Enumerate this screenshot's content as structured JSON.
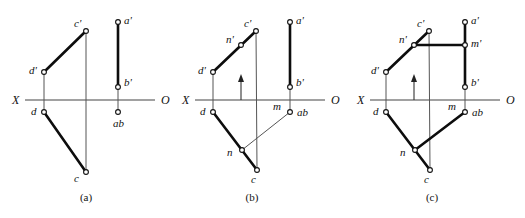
{
  "figure": {
    "background_color": "#ffffff",
    "ink_color": "#111111",
    "axis_label_left": "X",
    "axis_label_right": "O",
    "captions": [
      "(a)",
      "(b)",
      "(c)"
    ]
  },
  "panels": [
    {
      "id": "a",
      "caption": "(a)",
      "axis": {
        "left_label": "X",
        "right_label": "O",
        "y": 100,
        "x_start": 25,
        "x_end": 155
      },
      "points": [
        {
          "name": "c-prime",
          "label": "c'",
          "x": 86,
          "y": 31,
          "label_dx": -12,
          "label_dy": -4
        },
        {
          "name": "a-prime",
          "label": "a'",
          "x": 118,
          "y": 22,
          "label_dx": 6,
          "label_dy": 2
        },
        {
          "name": "d-prime",
          "label": "d'",
          "x": 44,
          "y": 72,
          "label_dx": -15,
          "label_dy": 2
        },
        {
          "name": "b-prime",
          "label": "b'",
          "x": 118,
          "y": 87,
          "label_dx": 6,
          "label_dy": -1
        },
        {
          "name": "d",
          "label": "d",
          "x": 44,
          "y": 112,
          "label_dx": -13,
          "label_dy": 3
        },
        {
          "name": "ab",
          "label": "ab",
          "x": 118,
          "y": 112,
          "label_dx": -5,
          "label_dy": 15
        },
        {
          "name": "c",
          "label": "c",
          "x": 86,
          "y": 172,
          "label_dx": -12,
          "label_dy": 10
        }
      ],
      "segments": [
        {
          "name": "dprime-cprime",
          "from": "d-prime",
          "to": "c-prime",
          "weight": "thick"
        },
        {
          "name": "d-c",
          "from": "d",
          "to": "c",
          "weight": "thick"
        },
        {
          "name": "aprime-bprime",
          "from": "a-prime",
          "to": "b-prime",
          "weight": "thick"
        },
        {
          "name": "cprime-c-projector",
          "from": "c-prime",
          "to": "c",
          "weight": "thin"
        },
        {
          "name": "dprime-d-projector",
          "from": "d-prime",
          "to": "d",
          "weight": "thin"
        },
        {
          "name": "bprime-ab-projector",
          "from": "b-prime",
          "to": "ab",
          "weight": "thin"
        }
      ],
      "arrow": null
    },
    {
      "id": "b",
      "caption": "(b)",
      "axis": {
        "left_label": "X",
        "right_label": "O",
        "y": 100,
        "x_start": 195,
        "x_end": 325
      },
      "points": [
        {
          "name": "c-prime",
          "label": "c'",
          "x": 256,
          "y": 31,
          "label_dx": -12,
          "label_dy": -4
        },
        {
          "name": "a-prime",
          "label": "a'",
          "x": 290,
          "y": 22,
          "label_dx": 6,
          "label_dy": 2
        },
        {
          "name": "n-prime",
          "label": "n'",
          "x": 241,
          "y": 45,
          "label_dx": -15,
          "label_dy": -2
        },
        {
          "name": "d-prime",
          "label": "d'",
          "x": 213,
          "y": 72,
          "label_dx": -15,
          "label_dy": 2
        },
        {
          "name": "b-prime",
          "label": "b'",
          "x": 290,
          "y": 87,
          "label_dx": 6,
          "label_dy": -1
        },
        {
          "name": "d",
          "label": "d",
          "x": 213,
          "y": 112,
          "label_dx": -13,
          "label_dy": 3
        },
        {
          "name": "ab",
          "label": "ab",
          "x": 290,
          "y": 112,
          "label_dx": 7,
          "label_dy": 4
        },
        {
          "name": "m",
          "label": "m",
          "x": 290,
          "y": 112,
          "label_dx": -17,
          "label_dy": -2
        },
        {
          "name": "n",
          "label": "n",
          "x": 242,
          "y": 150,
          "label_dx": -15,
          "label_dy": 6
        },
        {
          "name": "c",
          "label": "c",
          "x": 257,
          "y": 170,
          "label_dx": -6,
          "label_dy": 13
        }
      ],
      "segments": [
        {
          "name": "dprime-cprime",
          "from": "d-prime",
          "to": "c-prime",
          "weight": "thick"
        },
        {
          "name": "d-c",
          "from": "d",
          "to": "c",
          "weight": "thick"
        },
        {
          "name": "aprime-bprime",
          "from": "a-prime",
          "to": "b-prime",
          "weight": "thick"
        },
        {
          "name": "n-ab",
          "from": "n",
          "to": "ab",
          "weight": "thin"
        },
        {
          "name": "cprime-c-projector",
          "from": "c-prime",
          "to": "c",
          "weight": "thin"
        },
        {
          "name": "dprime-d-projector",
          "from": "d-prime",
          "to": "d",
          "weight": "thin"
        },
        {
          "name": "bprime-ab-projector",
          "from": "b-prime",
          "to": "ab",
          "weight": "thin"
        }
      ],
      "arrow": {
        "name": "projection-arrow",
        "x": 241,
        "y_from": 100,
        "y_to": 74
      }
    },
    {
      "id": "c",
      "caption": "(c)",
      "axis": {
        "left_label": "X",
        "right_label": "O",
        "y": 100,
        "x_start": 370,
        "x_end": 500
      },
      "points": [
        {
          "name": "c-prime",
          "label": "c'",
          "x": 429,
          "y": 31,
          "label_dx": -12,
          "label_dy": -4
        },
        {
          "name": "a-prime",
          "label": "a'",
          "x": 465,
          "y": 22,
          "label_dx": 6,
          "label_dy": 2
        },
        {
          "name": "n-prime",
          "label": "n'",
          "x": 414,
          "y": 45,
          "label_dx": -15,
          "label_dy": -2
        },
        {
          "name": "m-prime",
          "label": "m'",
          "x": 465,
          "y": 45,
          "label_dx": 6,
          "label_dy": 2
        },
        {
          "name": "d-prime",
          "label": "d'",
          "x": 386,
          "y": 72,
          "label_dx": -15,
          "label_dy": 2
        },
        {
          "name": "b-prime",
          "label": "b'",
          "x": 465,
          "y": 87,
          "label_dx": 6,
          "label_dy": -1
        },
        {
          "name": "d",
          "label": "d",
          "x": 386,
          "y": 112,
          "label_dx": -13,
          "label_dy": 3
        },
        {
          "name": "ab",
          "label": "ab",
          "x": 465,
          "y": 112,
          "label_dx": 7,
          "label_dy": 4
        },
        {
          "name": "m",
          "label": "m",
          "x": 465,
          "y": 112,
          "label_dx": -17,
          "label_dy": -2
        },
        {
          "name": "n",
          "label": "n",
          "x": 415,
          "y": 150,
          "label_dx": -15,
          "label_dy": 6
        },
        {
          "name": "c",
          "label": "c",
          "x": 430,
          "y": 170,
          "label_dx": -6,
          "label_dy": 13
        }
      ],
      "segments": [
        {
          "name": "dprime-cprime",
          "from": "d-prime",
          "to": "c-prime",
          "weight": "thick"
        },
        {
          "name": "d-c",
          "from": "d",
          "to": "c",
          "weight": "thick"
        },
        {
          "name": "nprime-mprime",
          "from": "n-prime",
          "to": "m-prime",
          "weight": "thick"
        },
        {
          "name": "aprime-bprime",
          "from": "a-prime",
          "to": "b-prime",
          "weight": "thick"
        },
        {
          "name": "n-ab",
          "from": "n",
          "to": "ab",
          "weight": "thick"
        },
        {
          "name": "cprime-c-projector",
          "from": "c-prime",
          "to": "c",
          "weight": "thin"
        },
        {
          "name": "dprime-d-projector",
          "from": "d-prime",
          "to": "d",
          "weight": "thin"
        },
        {
          "name": "bprime-ab-projector",
          "from": "b-prime",
          "to": "ab",
          "weight": "thin"
        }
      ],
      "arrow": {
        "name": "projection-arrow",
        "x": 414,
        "y_from": 100,
        "y_to": 74
      }
    }
  ],
  "caption_positions": [
    {
      "label": "(a)",
      "x": 86,
      "y": 201
    },
    {
      "label": "(b)",
      "x": 252,
      "y": 201
    },
    {
      "label": "(c)",
      "x": 432,
      "y": 201
    }
  ]
}
